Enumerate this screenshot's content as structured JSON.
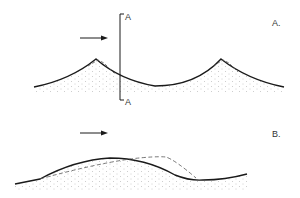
{
  "panels": [
    {
      "id": "A",
      "label": "A.",
      "section_marker_top": "A",
      "section_marker_bottom": "A",
      "wind_direction": "right"
    },
    {
      "id": "B",
      "label": "B.",
      "wind_direction": "right"
    }
  ],
  "colors": {
    "line": "#1a1a1a",
    "dashed": "#555555",
    "dots": "#999999",
    "background": "#ffffff"
  }
}
